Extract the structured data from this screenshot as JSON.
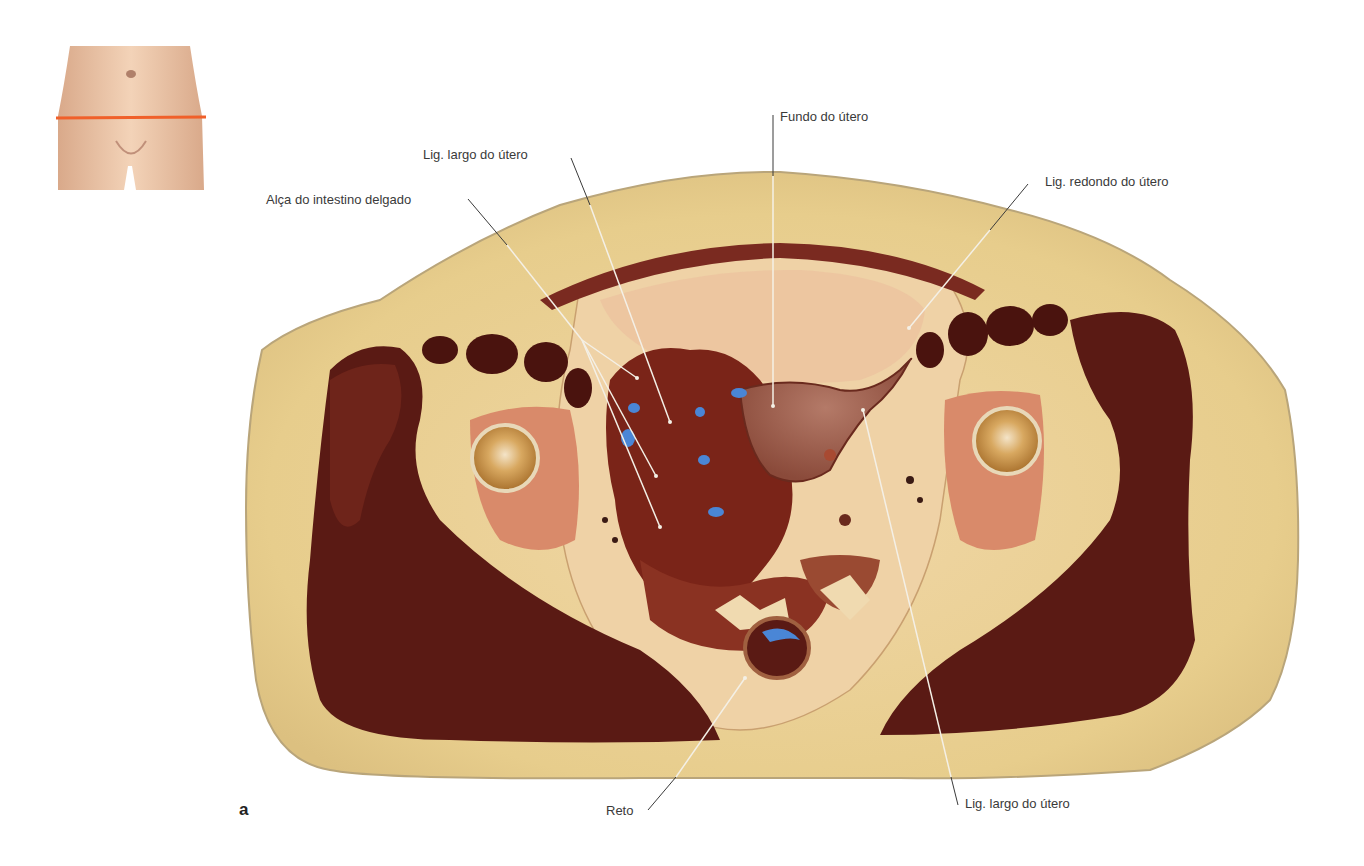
{
  "figure": {
    "panel_letter": "a",
    "orientation_thumbnail": {
      "description": "female lower abdomen with orange section line",
      "section_line_color": "#f0602a"
    },
    "labels": [
      {
        "id": "fundo-utero",
        "text": "Fundo do útero"
      },
      {
        "id": "lig-largo-top",
        "text": "Lig. largo do útero"
      },
      {
        "id": "alca-intestino",
        "text": "Alça do intestino delgado"
      },
      {
        "id": "lig-redondo",
        "text": "Lig. redondo do útero"
      },
      {
        "id": "reto",
        "text": "Reto"
      },
      {
        "id": "lig-largo-bottom",
        "text": "Lig. largo do útero"
      }
    ],
    "colors": {
      "fat": "#e9cf8f",
      "fat_edge": "#b9a57a",
      "muscle": "#5a1a14",
      "muscle_light": "#7a2a20",
      "bone_marrow": "#d98a6a",
      "femoral_head": "#c9903e",
      "bowel": "#7a2418",
      "uterus": "#9a5a4a",
      "blue_marker": "#4a86d6",
      "leader_dark": "#3a3a3a",
      "leader_light": "#f4f0e6",
      "skin": "#efc8a8"
    }
  }
}
